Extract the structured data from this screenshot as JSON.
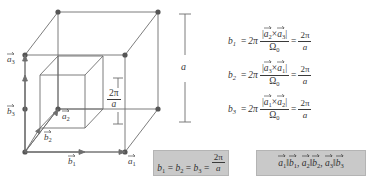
{
  "figure": {
    "name": "reciprocal-lattice-cube-diagram",
    "outer_cube_label": "a",
    "inner_cube_label": {
      "numerator": "2π",
      "denominator": "a"
    },
    "vectors": [
      {
        "id": "a3",
        "symbol": "a",
        "subscript": "3"
      },
      {
        "id": "b3",
        "symbol": "b",
        "subscript": "3"
      },
      {
        "id": "a2",
        "symbol": "a",
        "subscript": "2"
      },
      {
        "id": "b2",
        "symbol": "b",
        "subscript": "2"
      },
      {
        "id": "b1",
        "symbol": "b",
        "subscript": "1"
      },
      {
        "id": "a1",
        "symbol": "a",
        "subscript": "1"
      }
    ]
  },
  "equations": [
    {
      "lhs": "b",
      "lhs_sub": "1",
      "equals": "=",
      "coeff": "2π",
      "num_open": "|",
      "num_v1": "a",
      "num_v1_sub": "2",
      "num_cross": "×",
      "num_v2": "a",
      "num_v2_sub": "3",
      "num_close": "|",
      "den": "Ω",
      "den_sub": "0",
      "equals2": "=",
      "result_num": "2π",
      "result_den": "a"
    },
    {
      "lhs": "b",
      "lhs_sub": "2",
      "equals": "=",
      "coeff": "2π",
      "num_open": "|",
      "num_v1": "a",
      "num_v1_sub": "3",
      "num_cross": "×",
      "num_v2": "a",
      "num_v2_sub": "1",
      "num_close": "|",
      "den": "Ω",
      "den_sub": "0",
      "equals2": "=",
      "result_num": "2π",
      "result_den": "a"
    },
    {
      "lhs": "b",
      "lhs_sub": "3",
      "equals": "=",
      "coeff": "2π",
      "num_open": "|",
      "num_v1": "a",
      "num_v1_sub": "1",
      "num_cross": "×",
      "num_v2": "a",
      "num_v2_sub": "2",
      "num_close": "|",
      "den": "Ω",
      "den_sub": "0",
      "equals2": "=",
      "result_num": "2π",
      "result_den": "a"
    }
  ],
  "box_magnitudes": {
    "b1": "b",
    "b1_sub": "1",
    "eq1": "=",
    "b2": "b",
    "b2_sub": "2",
    "eq2": "=",
    "b3": "b",
    "b3_sub": "3",
    "eq3": "=",
    "num": "2π",
    "den": "a"
  },
  "box_parallel": {
    "pairs": [
      {
        "a": "a",
        "a_sub": "1",
        "par": "‖",
        "b": "b",
        "b_sub": "1",
        "sep": ","
      },
      {
        "a": "a",
        "a_sub": "2",
        "par": "‖",
        "b": "b",
        "b_sub": "2",
        "sep": ","
      },
      {
        "a": "a",
        "a_sub": "3",
        "par": "‖",
        "b": "b",
        "b_sub": "3",
        "sep": ""
      }
    ]
  },
  "colors": {
    "line": "#6e6e6e",
    "vertex": "#555555",
    "text": "#333333",
    "box_bg": "#c9c9c9",
    "background": "#ffffff"
  }
}
